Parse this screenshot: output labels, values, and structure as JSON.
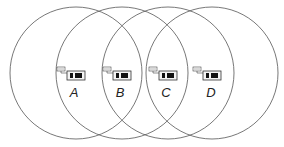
{
  "diagram": {
    "type": "overlapping-coverage-circles",
    "circle_radius": 66,
    "circle_stroke": "#555555",
    "nodes": [
      {
        "label": "A",
        "cx": 76,
        "cy": 73,
        "device_x": 57
      },
      {
        "label": "B",
        "cx": 122,
        "cy": 73,
        "device_x": 103
      },
      {
        "label": "C",
        "cx": 168,
        "cy": 73,
        "device_x": 149
      },
      {
        "label": "D",
        "cx": 212,
        "cy": 73,
        "device_x": 193
      }
    ]
  }
}
